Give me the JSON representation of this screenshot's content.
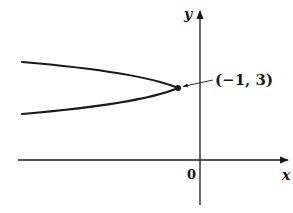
{
  "figure": {
    "colors": {
      "ink": "#1a1a1a",
      "background": "#ffffff"
    },
    "axes": {
      "x_label": "x",
      "y_label": "y",
      "origin_label": "0"
    },
    "curve": {
      "type": "parabola",
      "opens": "left",
      "vertex": {
        "x": -1,
        "y": 3
      }
    },
    "annotation": {
      "label": "(−1, 3)",
      "points_to": "vertex"
    }
  }
}
